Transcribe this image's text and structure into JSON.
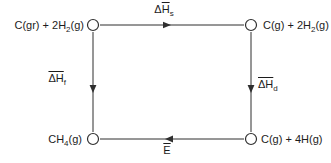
{
  "diagram": {
    "type": "thermochemical-cycle",
    "nodes": {
      "top_left": {
        "p0": "C(gr) + 2H",
        "sub": "2",
        "p1": "(g)"
      },
      "top_right": {
        "p0": "C(g) + 2H",
        "sub": "2",
        "p1": "(g)"
      },
      "bottom_left": {
        "p0": "CH",
        "sub": "4",
        "p1": "(g)"
      },
      "bottom_right": {
        "p0": "C(g) + 4H(g)",
        "sub": "",
        "p1": ""
      }
    },
    "edges": {
      "top": {
        "pre": "Δ",
        "bar": "H",
        "sub": "s",
        "direction": "right"
      },
      "left": {
        "pre": "",
        "bar": "ΔH",
        "sub": "f",
        "direction": "down"
      },
      "right": {
        "pre": "",
        "bar": "ΔH",
        "sub": "d",
        "direction": "down"
      },
      "bottom": {
        "pre": "",
        "bar": "E",
        "sub": "",
        "direction": "left"
      }
    },
    "colors": {
      "line": "#2f2f2f",
      "text": "#1c1c1c",
      "background": "#ffffff"
    }
  }
}
